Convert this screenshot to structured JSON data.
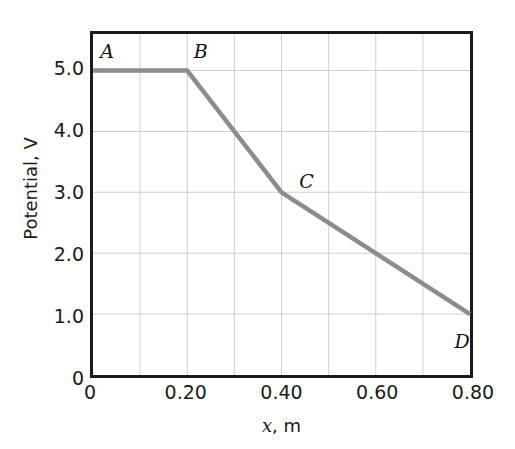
{
  "chart_data": {
    "type": "line",
    "title": "",
    "xlabel": "x, m",
    "ylabel": "Potential, V",
    "xlim": [
      0,
      0.8
    ],
    "ylim": [
      0,
      5.6
    ],
    "grid": true,
    "legend": "none",
    "x": [
      0,
      0.2,
      0.4,
      0.8
    ],
    "values": [
      5.0,
      5.0,
      3.0,
      1.0
    ],
    "series": [
      {
        "name": "Potential",
        "color": "#8c8c8c",
        "points": [
          {
            "label": "A",
            "x": 0,
            "y": 5.0
          },
          {
            "label": "B",
            "x": 0.2,
            "y": 5.0
          },
          {
            "label": "C",
            "x": 0.4,
            "y": 3.0
          },
          {
            "label": "D",
            "x": 0.8,
            "y": 1.0
          }
        ]
      }
    ],
    "annotations": [
      {
        "text": "A",
        "x": 0,
        "y": 5.0
      },
      {
        "text": "B",
        "x": 0.2,
        "y": 5.0
      },
      {
        "text": "C",
        "x": 0.4,
        "y": 3.0
      },
      {
        "text": "D",
        "x": 0.8,
        "y": 1.0
      }
    ],
    "xticks": [
      {
        "value": 0,
        "label": "0"
      },
      {
        "value": 0.2,
        "label": "0.20"
      },
      {
        "value": 0.4,
        "label": "0.40"
      },
      {
        "value": 0.6,
        "label": "0.60"
      },
      {
        "value": 0.8,
        "label": "0.80"
      }
    ],
    "yticks": [
      {
        "value": 0,
        "label": "0"
      },
      {
        "value": 1.0,
        "label": "1.0"
      },
      {
        "value": 2.0,
        "label": "2.0"
      },
      {
        "value": 3.0,
        "label": "3.0"
      },
      {
        "value": 4.0,
        "label": "4.0"
      },
      {
        "value": 5.0,
        "label": "5.0"
      }
    ],
    "x_minor_gridlines": [
      0.1,
      0.2,
      0.3,
      0.4,
      0.5,
      0.6,
      0.7
    ],
    "y_gridlines": [
      1.0,
      2.0,
      3.0,
      4.0,
      5.0
    ],
    "colors": {
      "line": "#8c8c8c",
      "grid": "#cfcfcf",
      "axis": "#1a1a1a",
      "text": "#1a1a1a",
      "background": "#ffffff"
    }
  },
  "axis_titles": {
    "x_variable": "x",
    "x_unit": ", m",
    "y_full": "Potential, V"
  }
}
